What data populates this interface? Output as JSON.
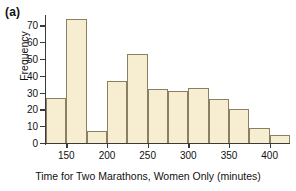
{
  "figure": {
    "panel_label": "(a)"
  },
  "chart_data": {
    "type": "bar",
    "title": "",
    "xlabel": "Time for Two Marathons, Women Only (minutes)",
    "ylabel": "Frequency",
    "bin_width": 25,
    "bin_starts": [
      125,
      150,
      175,
      200,
      225,
      250,
      275,
      300,
      325,
      350,
      375,
      400
    ],
    "categories": [
      "125-150",
      "150-175",
      "175-200",
      "200-225",
      "225-250",
      "250-275",
      "275-300",
      "300-325",
      "325-350",
      "350-375",
      "375-400",
      "400-425"
    ],
    "values": [
      27,
      74,
      7,
      37,
      53,
      32,
      31,
      33,
      26,
      20,
      9,
      5
    ],
    "xlim": [
      125,
      425
    ],
    "ylim": [
      0,
      75
    ],
    "xticks": [
      150,
      200,
      250,
      300,
      350,
      400
    ],
    "xtick_labels": [
      "150",
      "200",
      "250",
      "300",
      "350",
      "400"
    ],
    "yticks": [
      0,
      10,
      20,
      30,
      40,
      50,
      60,
      70
    ],
    "ytick_labels": [
      "0",
      "10",
      "20",
      "30",
      "40",
      "50",
      "60",
      "70"
    ],
    "grid": false,
    "legend": null,
    "bar_fill_color": "#f7eed2",
    "bar_edge_color": "#8a7f63",
    "axis_color": "#3a3a3a",
    "background_color": "#ffffff"
  }
}
